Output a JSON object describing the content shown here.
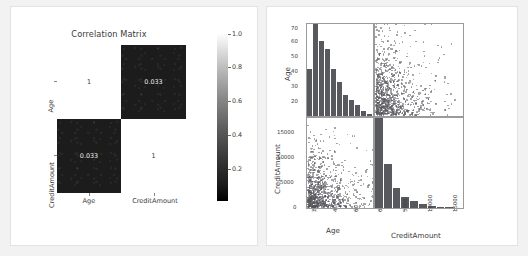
{
  "figure": {
    "background": "#f2f2f2",
    "panel_background": "#ffffff"
  },
  "chart_data": [
    {
      "type": "heatmap",
      "title": "Correlation Matrix",
      "xlabel": "",
      "ylabel": "",
      "categories_x": [
        "Age",
        "CreditAmount"
      ],
      "categories_y": [
        "Age",
        "CreditAmount"
      ],
      "matrix": [
        [
          1,
          0.033
        ],
        [
          0.033,
          1
        ]
      ],
      "cell_labels": [
        [
          "1",
          "0.033"
        ],
        [
          "0.033",
          "1"
        ]
      ],
      "cell_shading": [
        [
          "light",
          "dark"
        ],
        [
          "dark",
          "light"
        ]
      ],
      "colorbar": {
        "ticks": [
          "1.0",
          "0.8",
          "0.6",
          "0.4",
          "0.2"
        ],
        "tick_values": [
          1.0,
          0.8,
          0.6,
          0.4,
          0.2
        ],
        "vmin": 0.0,
        "vmax": 1.0,
        "colormap": "gray",
        "low_color": "#000000",
        "high_color": "#ffffff"
      },
      "grid": false,
      "annotation_color_dark_cell": "#f0f0f0",
      "annotation_color_light_cell": "#3a3a3a"
    },
    {
      "type": "scatter",
      "subtype": "scatter-matrix",
      "variables": [
        "Age",
        "CreditAmount"
      ],
      "marker_color": "#55555c",
      "bar_color": "#58585f",
      "axes": {
        "age": {
          "label": "Age",
          "ticks": [
            "20",
            "30",
            "40",
            "50",
            "60",
            "70"
          ],
          "tick_values": [
            20,
            30,
            40,
            50,
            60,
            70
          ],
          "range": [
            17,
            78
          ]
        },
        "credit": {
          "label": "CreditAmount",
          "ticks": [
            "0",
            "5000",
            "10000",
            "15000"
          ],
          "tick_values": [
            0,
            5000,
            10000,
            15000
          ],
          "range": [
            0,
            18500
          ]
        }
      },
      "panels": [
        {
          "position": "top-left",
          "kind": "histogram",
          "variable": "Age",
          "x": "Age",
          "y": "count",
          "bin_edges": [
            19,
            24,
            29,
            34,
            39,
            44,
            49,
            54,
            59,
            64,
            69,
            75
          ],
          "counts": [
            118,
            229,
            186,
            168,
            118,
            84,
            52,
            41,
            27,
            12,
            5
          ]
        },
        {
          "position": "top-right",
          "kind": "scatter",
          "x": "CreditAmount",
          "y": "Age",
          "n_points": 1000
        },
        {
          "position": "bottom-left",
          "kind": "scatter",
          "x": "Age",
          "y": "CreditAmount",
          "n_points": 1000
        },
        {
          "position": "bottom-right",
          "kind": "histogram",
          "variable": "CreditAmount",
          "x": "CreditAmount",
          "y": "count",
          "bin_edges": [
            250,
            2000,
            3750,
            5500,
            7250,
            9000,
            10750,
            12500,
            14250,
            16000,
            18500
          ],
          "counts": [
            505,
            246,
            110,
            61,
            37,
            20,
            10,
            6,
            4,
            1
          ]
        }
      ]
    }
  ]
}
